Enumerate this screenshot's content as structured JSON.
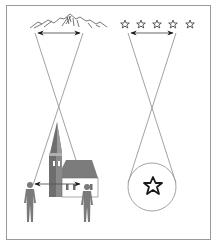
{
  "diagram": {
    "title": "",
    "colors": {
      "frame": "#9a9a9a",
      "lines": "#8a8a8a",
      "arrow": "#1a1a1a",
      "figure": "#7a7a7a",
      "church_tower": "#6e6e6e",
      "church_roof": "#7c7c7c",
      "church_wall": "#ffffff",
      "star": "#222222",
      "circle": "#8c8c8c"
    },
    "left_panel": {
      "top_object": "mountain-range",
      "bottom_objects": [
        "person-left",
        "church",
        "person-right"
      ],
      "arrows": [
        "top-double-arrow",
        "bottom-double-arrow"
      ]
    },
    "right_panel": {
      "top_object": "star-row",
      "star_count": 5,
      "bottom_objects": [
        "circle",
        "single-star"
      ],
      "arrows": [
        "top-double-arrow"
      ]
    }
  }
}
